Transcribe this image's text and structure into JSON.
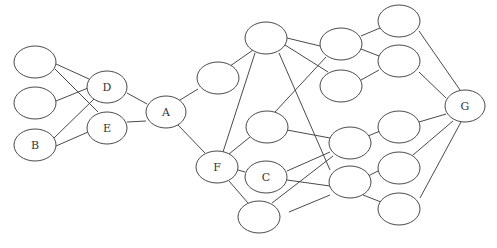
{
  "diagram": {
    "type": "network-graph",
    "colors": {
      "stroke": "#4a4a4a",
      "fill": "#ffffff",
      "text": "#333333",
      "background": "#ffffff"
    },
    "nodes": [
      {
        "id": "L1",
        "label": "",
        "cx": 35,
        "cy": 62,
        "rx": 21,
        "ry": 16
      },
      {
        "id": "L2",
        "label": "",
        "cx": 35,
        "cy": 103,
        "rx": 21,
        "ry": 16
      },
      {
        "id": "B",
        "label": "B",
        "cx": 35,
        "cy": 145,
        "rx": 21,
        "ry": 16
      },
      {
        "id": "D",
        "label": "D",
        "cx": 107,
        "cy": 87,
        "rx": 20,
        "ry": 16
      },
      {
        "id": "E",
        "label": "E",
        "cx": 107,
        "cy": 128,
        "rx": 20,
        "ry": 16
      },
      {
        "id": "A",
        "label": "A",
        "cx": 166,
        "cy": 112,
        "rx": 20,
        "ry": 16
      },
      {
        "id": "N1",
        "label": "",
        "cx": 218,
        "cy": 78,
        "rx": 21,
        "ry": 16
      },
      {
        "id": "T",
        "label": "",
        "cx": 266,
        "cy": 38,
        "rx": 21,
        "ry": 16
      },
      {
        "id": "F",
        "label": "F",
        "cx": 217,
        "cy": 167,
        "rx": 21,
        "ry": 16
      },
      {
        "id": "M1",
        "label": "",
        "cx": 267,
        "cy": 127,
        "rx": 21,
        "ry": 16
      },
      {
        "id": "C",
        "label": "C",
        "cx": 266,
        "cy": 177,
        "rx": 21,
        "ry": 16
      },
      {
        "id": "Bt",
        "label": "",
        "cx": 259,
        "cy": 217,
        "rx": 21,
        "ry": 16
      },
      {
        "id": "R1",
        "label": "",
        "cx": 341,
        "cy": 44,
        "rx": 21,
        "ry": 16
      },
      {
        "id": "R2",
        "label": "",
        "cx": 341,
        "cy": 86,
        "rx": 21,
        "ry": 16
      },
      {
        "id": "R3",
        "label": "",
        "cx": 350,
        "cy": 143,
        "rx": 21,
        "ry": 16
      },
      {
        "id": "R4",
        "label": "",
        "cx": 350,
        "cy": 182,
        "rx": 21,
        "ry": 16
      },
      {
        "id": "S1",
        "label": "",
        "cx": 399,
        "cy": 21,
        "rx": 21,
        "ry": 16
      },
      {
        "id": "S2",
        "label": "",
        "cx": 399,
        "cy": 61,
        "rx": 21,
        "ry": 16
      },
      {
        "id": "S3",
        "label": "",
        "cx": 399,
        "cy": 127,
        "rx": 21,
        "ry": 16
      },
      {
        "id": "S4",
        "label": "",
        "cx": 399,
        "cy": 168,
        "rx": 21,
        "ry": 16
      },
      {
        "id": "S5",
        "label": "",
        "cx": 399,
        "cy": 209,
        "rx": 21,
        "ry": 16
      },
      {
        "id": "G",
        "label": "G",
        "cx": 465,
        "cy": 106,
        "rx": 20,
        "ry": 16
      }
    ],
    "edges": [
      {
        "x1": 56,
        "y1": 64,
        "x2": 89,
        "y2": 79
      },
      {
        "x1": 55,
        "y1": 69,
        "x2": 98,
        "y2": 112
      },
      {
        "x1": 56,
        "y1": 101,
        "x2": 88,
        "y2": 88
      },
      {
        "x1": 54,
        "y1": 138,
        "x2": 94,
        "y2": 99
      },
      {
        "x1": 56,
        "y1": 146,
        "x2": 88,
        "y2": 132
      },
      {
        "x1": 127,
        "y1": 93,
        "x2": 147,
        "y2": 104
      },
      {
        "x1": 127,
        "y1": 122,
        "x2": 146,
        "y2": 121
      },
      {
        "x1": 180,
        "y1": 100,
        "x2": 198,
        "y2": 89
      },
      {
        "x1": 178,
        "y1": 125,
        "x2": 205,
        "y2": 153
      },
      {
        "x1": 223,
        "y1": 152,
        "x2": 255,
        "y2": 53
      },
      {
        "x1": 229,
        "y1": 154,
        "x2": 250,
        "y2": 137
      },
      {
        "x1": 238,
        "y1": 170,
        "x2": 245,
        "y2": 172
      },
      {
        "x1": 229,
        "y1": 181,
        "x2": 248,
        "y2": 203
      },
      {
        "x1": 223,
        "y1": 71,
        "x2": 253,
        "y2": 50
      },
      {
        "x1": 287,
        "y1": 38,
        "x2": 320,
        "y2": 46
      },
      {
        "x1": 285,
        "y1": 45,
        "x2": 328,
        "y2": 72
      },
      {
        "x1": 279,
        "y1": 53,
        "x2": 330,
        "y2": 170
      },
      {
        "x1": 275,
        "y1": 112,
        "x2": 326,
        "y2": 57
      },
      {
        "x1": 287,
        "y1": 130,
        "x2": 330,
        "y2": 138
      },
      {
        "x1": 287,
        "y1": 171,
        "x2": 330,
        "y2": 152
      },
      {
        "x1": 287,
        "y1": 180,
        "x2": 330,
        "y2": 186
      },
      {
        "x1": 272,
        "y1": 203,
        "x2": 333,
        "y2": 156
      },
      {
        "x1": 289,
        "y1": 212,
        "x2": 330,
        "y2": 195
      },
      {
        "x1": 361,
        "y1": 36,
        "x2": 380,
        "y2": 28
      },
      {
        "x1": 361,
        "y1": 49,
        "x2": 379,
        "y2": 56
      },
      {
        "x1": 361,
        "y1": 80,
        "x2": 379,
        "y2": 70
      },
      {
        "x1": 368,
        "y1": 136,
        "x2": 380,
        "y2": 131
      },
      {
        "x1": 368,
        "y1": 176,
        "x2": 380,
        "y2": 170
      },
      {
        "x1": 363,
        "y1": 195,
        "x2": 381,
        "y2": 202
      },
      {
        "x1": 419,
        "y1": 31,
        "x2": 460,
        "y2": 90
      },
      {
        "x1": 419,
        "y1": 72,
        "x2": 446,
        "y2": 98
      },
      {
        "x1": 419,
        "y1": 122,
        "x2": 446,
        "y2": 114
      },
      {
        "x1": 413,
        "y1": 155,
        "x2": 453,
        "y2": 121
      },
      {
        "x1": 420,
        "y1": 198,
        "x2": 461,
        "y2": 122
      }
    ]
  }
}
